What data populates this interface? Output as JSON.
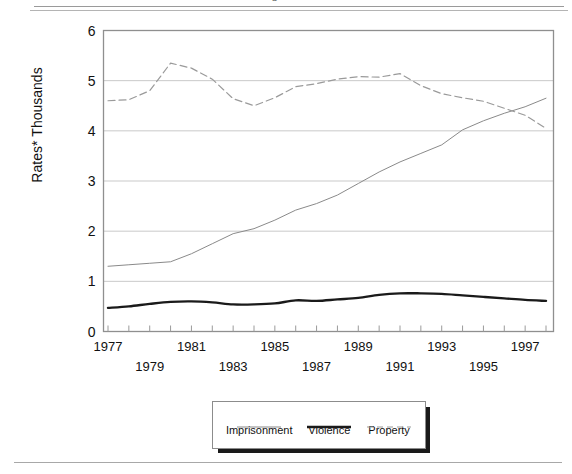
{
  "page": {
    "top_fragment": "p",
    "has_top_rules": true,
    "has_bottom_rule": true
  },
  "chart_data": {
    "type": "line",
    "title": "",
    "xlabel": "",
    "ylabel": "Rates*",
    "ylabel_line2": "Thousands",
    "ylim": [
      0,
      6
    ],
    "yticks": [
      "0",
      "1",
      "2",
      "3",
      "4",
      "5",
      "6"
    ],
    "ytick_values": [
      0,
      1,
      2,
      3,
      4,
      5,
      6
    ],
    "xlim": [
      1977,
      1998
    ],
    "grid": true,
    "grid_axis": "y",
    "legend_position": "below-center",
    "x": [
      1977,
      1978,
      1979,
      1980,
      1981,
      1982,
      1983,
      1984,
      1985,
      1986,
      1987,
      1988,
      1989,
      1990,
      1991,
      1992,
      1993,
      1994,
      1995,
      1996,
      1997,
      1998
    ],
    "xticks_row1": [
      "1977",
      "1981",
      "1985",
      "1989",
      "1993",
      "1997"
    ],
    "xticks_row2": [
      "1979",
      "1983",
      "1987",
      "1991",
      "1995"
    ],
    "xtick_all": [
      "1977",
      "1978",
      "1979",
      "1980",
      "1981",
      "1982",
      "1983",
      "1984",
      "1985",
      "1986",
      "1987",
      "1988",
      "1989",
      "1990",
      "1991",
      "1992",
      "1993",
      "1994",
      "1995",
      "1996",
      "1997",
      "1998"
    ],
    "series": [
      {
        "name": "Imprisonment",
        "style": "solid-thin",
        "color": "#8a8a8a",
        "width": 1,
        "values": [
          1.3,
          1.33,
          1.36,
          1.39,
          1.55,
          1.75,
          1.95,
          2.05,
          2.22,
          2.42,
          2.55,
          2.72,
          2.95,
          3.18,
          3.38,
          3.55,
          3.72,
          4.02,
          4.2,
          4.35,
          4.48,
          4.65
        ]
      },
      {
        "name": "Violence",
        "style": "solid-thick",
        "color": "#1a1a1a",
        "width": 2.4,
        "values": [
          0.47,
          0.5,
          0.55,
          0.59,
          0.6,
          0.58,
          0.54,
          0.54,
          0.56,
          0.62,
          0.61,
          0.64,
          0.67,
          0.73,
          0.76,
          0.76,
          0.75,
          0.72,
          0.69,
          0.66,
          0.63,
          0.61
        ]
      },
      {
        "name": "Property",
        "style": "dashed",
        "color": "#9a9a9a",
        "width": 1.2,
        "values": [
          4.6,
          4.62,
          4.8,
          5.35,
          5.25,
          5.03,
          4.64,
          4.5,
          4.66,
          4.88,
          4.94,
          5.03,
          5.08,
          5.07,
          5.14,
          4.9,
          4.74,
          4.66,
          4.59,
          4.45,
          4.31,
          4.05
        ]
      }
    ]
  },
  "legend": {
    "items": [
      {
        "label": "Imprisonment",
        "style": "solid-thin",
        "color": "#8a8a8a"
      },
      {
        "label": "Violence",
        "style": "solid-thick",
        "color": "#1a1a1a"
      },
      {
        "label": "Property",
        "style": "dashed",
        "color": "#9a9a9a"
      }
    ]
  }
}
